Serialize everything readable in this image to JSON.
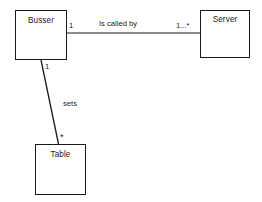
{
  "diagram": {
    "type": "uml-class-diagram",
    "background_color": "#ffffff",
    "line_color": "#1a1a1a",
    "text_color": "#1a1a1a",
    "classes": [
      {
        "id": "busser",
        "name": "Busser"
      },
      {
        "id": "server",
        "name": "Server"
      },
      {
        "id": "table",
        "name": "Table"
      }
    ],
    "associations": [
      {
        "id": "busser-server",
        "label": "Is called by",
        "source": "Busser",
        "target": "Server",
        "source_multiplicity": "1",
        "target_multiplicity": "1...*"
      },
      {
        "id": "busser-table",
        "label": "sets",
        "source": "Busser",
        "target": "Table",
        "source_multiplicity": "1",
        "target_multiplicity": "*"
      }
    ]
  }
}
